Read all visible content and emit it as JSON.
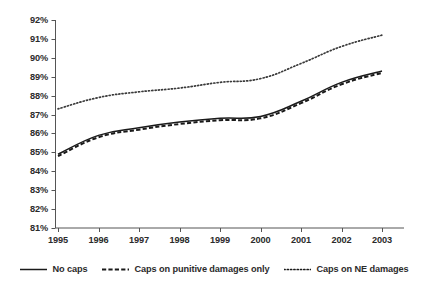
{
  "chart_data": {
    "type": "line",
    "title": "",
    "subtitle": "",
    "xlabel": "",
    "ylabel": "",
    "categories": [
      "1995",
      "1996",
      "1997",
      "1998",
      "1999",
      "2000",
      "2001",
      "2002",
      "2003"
    ],
    "x": [
      1995,
      1996,
      1997,
      1998,
      1999,
      2000,
      2001,
      2002,
      2003
    ],
    "ylim": [
      81,
      92
    ],
    "ytick_labels": [
      "92%",
      "91%",
      "90%",
      "89%",
      "88%",
      "87%",
      "86%",
      "85%",
      "84%",
      "83%",
      "82%",
      "81%"
    ],
    "ytick_values": [
      92,
      91,
      90,
      89,
      88,
      87,
      86,
      85,
      84,
      83,
      82,
      81
    ],
    "grid": false,
    "legend_position": "bottom",
    "series": [
      {
        "name": "No caps",
        "style": "solid",
        "color": "#1a1a1a",
        "values": [
          84.9,
          85.9,
          86.3,
          86.6,
          86.8,
          86.9,
          87.7,
          88.7,
          89.3
        ]
      },
      {
        "name": "Caps on punitive damages only",
        "style": "dashed",
        "color": "#1a1a1a",
        "values": [
          84.8,
          85.8,
          86.2,
          86.5,
          86.7,
          86.8,
          87.6,
          88.6,
          89.2
        ]
      },
      {
        "name": "Caps on NE damages",
        "style": "dotted",
        "color": "#3a3a3a",
        "values": [
          87.3,
          87.9,
          88.2,
          88.4,
          88.7,
          88.9,
          89.7,
          90.6,
          91.2
        ]
      }
    ]
  },
  "axes": {
    "y_ticks": [
      {
        "label": "92%",
        "value": 92
      },
      {
        "label": "91%",
        "value": 91
      },
      {
        "label": "90%",
        "value": 90
      },
      {
        "label": "89%",
        "value": 89
      },
      {
        "label": "88%",
        "value": 88
      },
      {
        "label": "87%",
        "value": 87
      },
      {
        "label": "86%",
        "value": 86
      },
      {
        "label": "85%",
        "value": 85
      },
      {
        "label": "84%",
        "value": 84
      },
      {
        "label": "83%",
        "value": 83
      },
      {
        "label": "82%",
        "value": 82
      },
      {
        "label": "81%",
        "value": 81
      }
    ],
    "x_ticks": [
      {
        "label": "1995"
      },
      {
        "label": "1996"
      },
      {
        "label": "1997"
      },
      {
        "label": "1998"
      },
      {
        "label": "1999"
      },
      {
        "label": "2000"
      },
      {
        "label": "2001"
      },
      {
        "label": "2002"
      },
      {
        "label": "2003"
      }
    ]
  },
  "legend": {
    "items": [
      {
        "label": "No caps",
        "style": "solid"
      },
      {
        "label": "Caps on punitive damages only",
        "style": "dashed"
      },
      {
        "label": "Caps on NE damages",
        "style": "dotted"
      }
    ]
  },
  "colors": {
    "axis": "#555555",
    "line": "#1a1a1a",
    "text": "#2b2b2b",
    "background": "#ffffff"
  }
}
